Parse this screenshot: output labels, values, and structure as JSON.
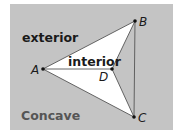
{
  "diagram": {
    "title": "Concave",
    "region_labels": {
      "exterior": "exterior",
      "interior": "interior"
    },
    "points": [
      {
        "name": "A",
        "x": 43,
        "y": 69
      },
      {
        "name": "B",
        "x": 135,
        "y": 21
      },
      {
        "name": "D",
        "x": 112,
        "y": 69
      },
      {
        "name": "C",
        "x": 134,
        "y": 117
      }
    ],
    "polygon_order": [
      "A",
      "B",
      "D",
      "C"
    ],
    "segments": [
      [
        "A",
        "D"
      ],
      [
        "B",
        "C"
      ]
    ],
    "colors": {
      "background": "#c4c4c4",
      "interior_fill": "#ffffff",
      "line": "#444444",
      "label_text": "#1a1a1a",
      "caption_text": "#555555"
    }
  }
}
